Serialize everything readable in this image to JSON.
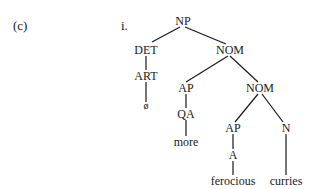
{
  "example_label": "(c)",
  "sub_label": "i.",
  "tree": {
    "nodes": [
      {
        "id": "np",
        "label": "NP"
      },
      {
        "id": "det",
        "label": "DET"
      },
      {
        "id": "nom1",
        "label": "NOM"
      },
      {
        "id": "art",
        "label": "ART"
      },
      {
        "id": "null",
        "label": "ø"
      },
      {
        "id": "ap1",
        "label": "AP"
      },
      {
        "id": "nom2",
        "label": "NOM"
      },
      {
        "id": "qa",
        "label": "QA"
      },
      {
        "id": "more",
        "label": "more"
      },
      {
        "id": "ap2",
        "label": "AP"
      },
      {
        "id": "n",
        "label": "N"
      },
      {
        "id": "a",
        "label": "A"
      },
      {
        "id": "ferocious",
        "label": "ferocious"
      },
      {
        "id": "curries",
        "label": "curries"
      }
    ],
    "edges": [
      [
        "np",
        "det"
      ],
      [
        "np",
        "nom1"
      ],
      [
        "det",
        "art"
      ],
      [
        "art",
        "null"
      ],
      [
        "nom1",
        "ap1"
      ],
      [
        "nom1",
        "nom2"
      ],
      [
        "ap1",
        "qa"
      ],
      [
        "qa",
        "more"
      ],
      [
        "nom2",
        "ap2"
      ],
      [
        "nom2",
        "n"
      ],
      [
        "ap2",
        "a"
      ],
      [
        "a",
        "ferocious"
      ],
      [
        "n",
        "curries"
      ]
    ]
  }
}
